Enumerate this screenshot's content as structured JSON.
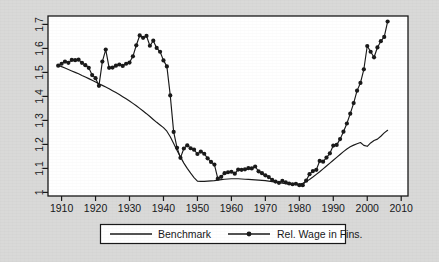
{
  "chart_data": {
    "type": "line",
    "title": "",
    "subtitle": "",
    "xlabel": "",
    "ylabel": "",
    "xlim": [
      1906,
      2012
    ],
    "ylim": [
      0.985,
      1.735
    ],
    "grid": false,
    "legend_position": "bottom-center",
    "xticks": [
      1910,
      1920,
      1930,
      1940,
      1950,
      1960,
      1970,
      1980,
      1990,
      2000,
      2010
    ],
    "xtick_labels": [
      "1910",
      "1920",
      "1930",
      "1940",
      "1950",
      "1960",
      "1970",
      "1980",
      "1990",
      "2000",
      "2010"
    ],
    "yticks": [
      1,
      1.1,
      1.2,
      1.3,
      1.4,
      1.5,
      1.6,
      1.7
    ],
    "ytick_labels": [
      "1",
      "1.1",
      "1.2",
      "1.3",
      "1.4",
      "1.5",
      "1.6",
      "1.7"
    ],
    "series": [
      {
        "name": "Benchmark",
        "marker": "none",
        "color": "#1a1a1a",
        "x": [
          1909,
          1910,
          1911,
          1912,
          1913,
          1914,
          1915,
          1916,
          1917,
          1918,
          1919,
          1920,
          1921,
          1922,
          1923,
          1924,
          1925,
          1926,
          1927,
          1928,
          1929,
          1930,
          1931,
          1932,
          1933,
          1934,
          1935,
          1936,
          1937,
          1938,
          1939,
          1940,
          1941,
          1942,
          1943,
          1944,
          1945,
          1946,
          1947,
          1948,
          1949,
          1950,
          1951,
          1952,
          1953,
          1954,
          1955,
          1956,
          1957,
          1958,
          1959,
          1960,
          1961,
          1962,
          1963,
          1964,
          1965,
          1966,
          1967,
          1968,
          1969,
          1970,
          1971,
          1972,
          1973,
          1974,
          1975,
          1976,
          1977,
          1978,
          1979,
          1980,
          1981,
          1982,
          1983,
          1984,
          1985,
          1986,
          1987,
          1988,
          1989,
          1990,
          1991,
          1992,
          1993,
          1994,
          1995,
          1996,
          1997,
          1998,
          1999,
          2000,
          2001,
          2002,
          2003,
          2004,
          2005,
          2006
        ],
        "y": [
          1.53,
          1.524,
          1.518,
          1.512,
          1.506,
          1.5,
          1.494,
          1.487,
          1.481,
          1.474,
          1.467,
          1.46,
          1.453,
          1.446,
          1.439,
          1.432,
          1.424,
          1.416,
          1.408,
          1.399,
          1.39,
          1.381,
          1.371,
          1.361,
          1.35,
          1.339,
          1.328,
          1.316,
          1.304,
          1.292,
          1.281,
          1.27,
          1.255,
          1.232,
          1.204,
          1.175,
          1.148,
          1.122,
          1.1,
          1.08,
          1.062,
          1.047,
          1.046,
          1.046,
          1.047,
          1.048,
          1.049,
          1.051,
          1.053,
          1.055,
          1.056,
          1.057,
          1.057,
          1.057,
          1.056,
          1.055,
          1.054,
          1.053,
          1.052,
          1.051,
          1.05,
          1.049,
          1.047,
          1.045,
          1.043,
          1.04,
          1.038,
          1.036,
          1.034,
          1.033,
          1.033,
          1.034,
          1.038,
          1.045,
          1.054,
          1.064,
          1.075,
          1.086,
          1.098,
          1.11,
          1.122,
          1.134,
          1.146,
          1.158,
          1.17,
          1.181,
          1.19,
          1.197,
          1.203,
          1.208,
          1.196,
          1.192,
          1.206,
          1.216,
          1.222,
          1.234,
          1.248,
          1.259
        ]
      },
      {
        "name": "Rel. Wage in Fins.",
        "marker": "circle",
        "color": "#1a1a1a",
        "x": [
          1909,
          1910,
          1911,
          1912,
          1913,
          1914,
          1915,
          1916,
          1917,
          1918,
          1919,
          1920,
          1921,
          1922,
          1923,
          1924,
          1925,
          1926,
          1927,
          1928,
          1929,
          1930,
          1931,
          1932,
          1933,
          1934,
          1935,
          1936,
          1937,
          1938,
          1939,
          1940,
          1941,
          1942,
          1943,
          1944,
          1945,
          1946,
          1947,
          1948,
          1949,
          1950,
          1951,
          1952,
          1953,
          1954,
          1955,
          1956,
          1957,
          1958,
          1959,
          1960,
          1961,
          1962,
          1963,
          1964,
          1965,
          1966,
          1967,
          1968,
          1969,
          1970,
          1971,
          1972,
          1973,
          1974,
          1975,
          1976,
          1977,
          1978,
          1979,
          1980,
          1981,
          1982,
          1983,
          1984,
          1985,
          1986,
          1987,
          1988,
          1989,
          1990,
          1991,
          1992,
          1993,
          1994,
          1995,
          1996,
          1997,
          1998,
          1999,
          2000,
          2001,
          2002,
          2003,
          2004,
          2005,
          2006
        ],
        "y": [
          1.528,
          1.536,
          1.545,
          1.54,
          1.552,
          1.551,
          1.553,
          1.54,
          1.53,
          1.519,
          1.489,
          1.476,
          1.444,
          1.545,
          1.595,
          1.519,
          1.52,
          1.528,
          1.533,
          1.527,
          1.536,
          1.541,
          1.567,
          1.613,
          1.654,
          1.644,
          1.652,
          1.611,
          1.632,
          1.602,
          1.586,
          1.55,
          1.525,
          1.404,
          1.252,
          1.186,
          1.144,
          1.183,
          1.196,
          1.184,
          1.178,
          1.16,
          1.17,
          1.161,
          1.142,
          1.127,
          1.116,
          1.057,
          1.065,
          1.08,
          1.084,
          1.086,
          1.078,
          1.095,
          1.094,
          1.096,
          1.101,
          1.1,
          1.108,
          1.088,
          1.08,
          1.071,
          1.064,
          1.052,
          1.045,
          1.04,
          1.048,
          1.042,
          1.037,
          1.034,
          1.036,
          1.03,
          1.03,
          1.049,
          1.076,
          1.089,
          1.094,
          1.131,
          1.128,
          1.145,
          1.163,
          1.195,
          1.198,
          1.222,
          1.253,
          1.287,
          1.328,
          1.372,
          1.424,
          1.456,
          1.513,
          1.61,
          1.586,
          1.563,
          1.604,
          1.63,
          1.648,
          1.712
        ]
      }
    ]
  },
  "legend": {
    "items": [
      {
        "label": "Benchmark",
        "marker": "none"
      },
      {
        "label": "Rel. Wage in Fins.",
        "marker": "circle"
      }
    ]
  }
}
